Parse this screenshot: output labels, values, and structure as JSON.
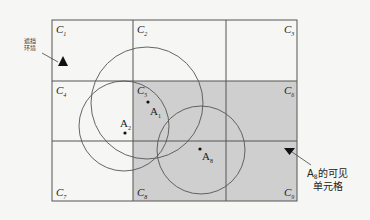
{
  "diagram": {
    "shade_color": "#cfcfcf",
    "line_color": "#555555",
    "background": "#f6f6f4",
    "cells": [
      {
        "id": "C1",
        "letter": "C",
        "sub": "1"
      },
      {
        "id": "C2",
        "letter": "C",
        "sub": "2"
      },
      {
        "id": "C3",
        "letter": "C",
        "sub": "3"
      },
      {
        "id": "C4",
        "letter": "C",
        "sub": "4"
      },
      {
        "id": "C5",
        "letter": "C",
        "sub": "5"
      },
      {
        "id": "C6",
        "letter": "C",
        "sub": "6"
      },
      {
        "id": "C7",
        "letter": "C",
        "sub": "7"
      },
      {
        "id": "C8",
        "letter": "C",
        "sub": "8"
      },
      {
        "id": "C9",
        "letter": "C",
        "sub": "9"
      }
    ],
    "shaded_cells": [
      "C5",
      "C6",
      "C8",
      "C9"
    ],
    "points": [
      {
        "id": "A1",
        "letter": "A",
        "sub": "1"
      },
      {
        "id": "A2",
        "letter": "A",
        "sub": "2"
      },
      {
        "id": "A8",
        "letter": "A",
        "sub": "8"
      }
    ],
    "annotations": {
      "left_label_line1": "遮挡",
      "left_label_line2": "环境",
      "right_label_prefix": "A",
      "right_label_sub": "8",
      "right_label_line1": "的可见",
      "right_label_line2": "单元格"
    }
  }
}
